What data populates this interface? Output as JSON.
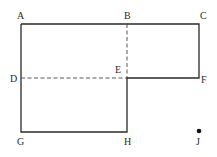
{
  "diagram": {
    "points": {
      "A": "A",
      "B": "B",
      "C": "C",
      "D": "D",
      "E": "E",
      "F": "F",
      "G": "G",
      "H": "H",
      "J": "J"
    },
    "stroke_color": "#2a2a2a"
  }
}
